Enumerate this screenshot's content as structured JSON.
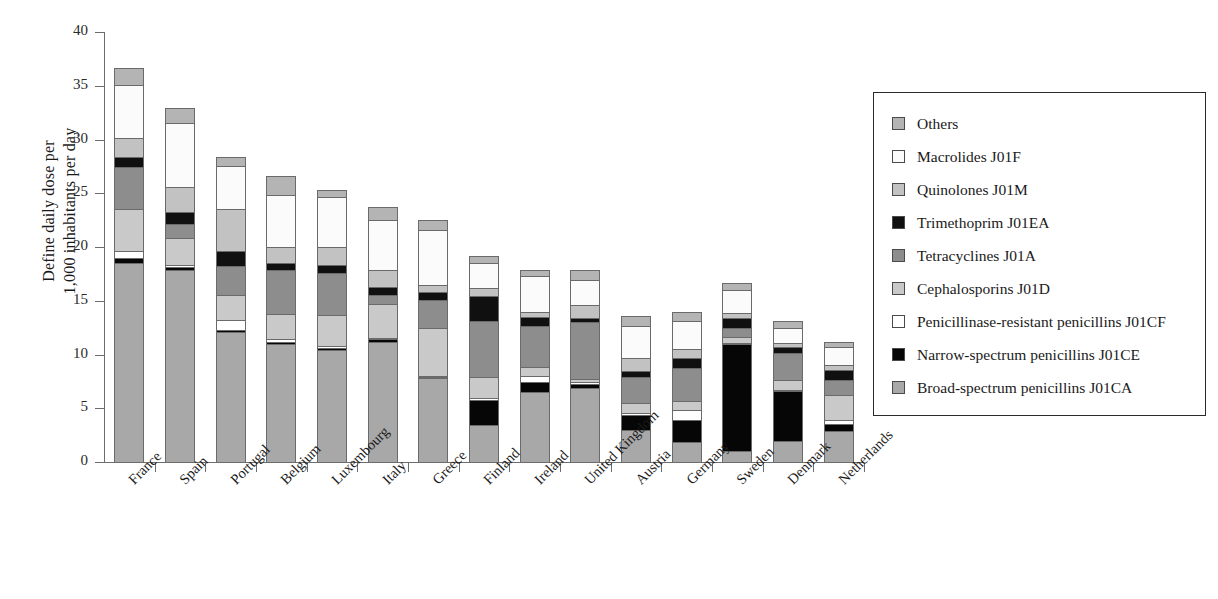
{
  "axes": {
    "y_title_line1": "Define daily dose per",
    "y_title_line2": "1,000 inhabitants per day",
    "y_ticks": [
      "0",
      "5",
      "10",
      "15",
      "20",
      "25",
      "30",
      "35",
      "40"
    ]
  },
  "legend": {
    "items": [
      {
        "label": "Others",
        "color": "#b4b4b4"
      },
      {
        "label": "Macrolides J01F",
        "color": "#fbfbfb"
      },
      {
        "label": "Quinolones J01M",
        "color": "#c2c2c2"
      },
      {
        "label": "Trimethoprim J01EA",
        "color": "#101010"
      },
      {
        "label": "Tetracyclines J01A",
        "color": "#8d8d8d"
      },
      {
        "label": "Cephalosporins J01D",
        "color": "#c9c9c9"
      },
      {
        "label": "Penicillinase-resistant penicillins J01CF",
        "color": "#ffffff"
      },
      {
        "label": "Narrow-spectrum penicillins J01CE",
        "color": "#060606"
      },
      {
        "label": "Broad-spectrum penicillins J01CA",
        "color": "#a8a8a8"
      }
    ]
  },
  "chart_data": {
    "type": "bar",
    "stacked": true,
    "title": "",
    "xlabel": "",
    "ylabel": "Define daily dose per 1,000 inhabitants per day",
    "ylim": [
      0,
      40
    ],
    "ytick_step": 5,
    "grid": false,
    "legend_position": "right",
    "categories": [
      "France",
      "Spain",
      "Portugal",
      "Belgium",
      "Luxembourg",
      "Italy",
      "Greece",
      "Finland",
      "Ireland",
      "United Kingdom",
      "Austria",
      "Germany",
      "Sweden",
      "Denmark",
      "Netherlands"
    ],
    "series": [
      {
        "name": "Broad-spectrum penicillins J01CA",
        "color": "#a8a8a8",
        "values": [
          18.5,
          17.9,
          12.1,
          11.0,
          10.4,
          11.2,
          7.8,
          3.4,
          6.5,
          6.9,
          3.0,
          1.9,
          1.0,
          2.0,
          2.9
        ]
      },
      {
        "name": "Narrow-spectrum penicillins J01CE",
        "color": "#060606",
        "values": [
          0.5,
          0.2,
          0.2,
          0.2,
          0.2,
          0.2,
          0.1,
          2.4,
          0.9,
          0.4,
          1.4,
          2.0,
          10.0,
          4.6,
          0.6
        ]
      },
      {
        "name": "Penicillinase-resistant penicillins J01CF",
        "color": "#ffffff",
        "values": [
          0.6,
          0.2,
          0.9,
          0.2,
          0.2,
          0.1,
          0.1,
          0.2,
          0.6,
          0.1,
          0.2,
          0.9,
          0.1,
          0.1,
          0.4
        ]
      },
      {
        "name": "Cephalosporins J01D",
        "color": "#c9c9c9",
        "values": [
          3.9,
          2.5,
          2.3,
          2.4,
          2.9,
          3.2,
          4.5,
          1.9,
          0.8,
          0.3,
          0.9,
          0.9,
          0.5,
          0.9,
          2.3
        ]
      },
      {
        "name": "Tetracyclines J01A",
        "color": "#8d8d8d",
        "values": [
          3.9,
          1.3,
          2.7,
          4.1,
          3.9,
          0.8,
          2.6,
          5.2,
          3.9,
          5.3,
          2.4,
          3.0,
          0.9,
          2.5,
          1.4
        ]
      },
      {
        "name": "Trimethoprim J01EA",
        "color": "#101010",
        "values": [
          1.0,
          1.2,
          1.4,
          0.6,
          0.7,
          0.8,
          0.7,
          2.3,
          0.8,
          0.4,
          0.6,
          1.0,
          0.9,
          0.6,
          1.0
        ]
      },
      {
        "name": "Quinolones J01M",
        "color": "#c2c2c2",
        "values": [
          1.7,
          2.3,
          3.9,
          1.5,
          1.7,
          1.6,
          0.7,
          0.8,
          0.5,
          1.2,
          1.2,
          0.8,
          0.5,
          0.4,
          0.4
        ]
      },
      {
        "name": "Macrolides J01F",
        "color": "#fbfbfb",
        "values": [
          5.0,
          5.9,
          4.0,
          4.8,
          4.7,
          4.6,
          5.1,
          2.3,
          3.3,
          2.3,
          3.0,
          2.6,
          2.1,
          1.4,
          1.7
        ]
      },
      {
        "name": "Others",
        "color": "#b4b4b4",
        "values": [
          1.6,
          1.4,
          0.9,
          1.8,
          0.6,
          1.2,
          0.9,
          0.7,
          0.6,
          1.0,
          0.9,
          0.9,
          0.7,
          0.6,
          0.5
        ]
      }
    ],
    "totals": [
      36.7,
      32.4,
      28.7,
      26.6,
      25.3,
      23.8,
      22.5,
      19.2,
      18.1,
      17.9,
      13.6,
      13.3,
      13.3,
      11.1,
      8.6
    ]
  }
}
